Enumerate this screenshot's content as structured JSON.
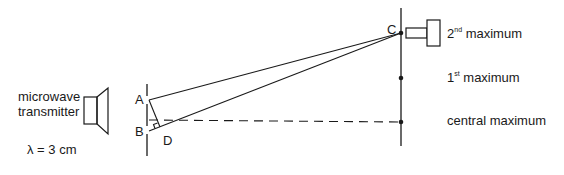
{
  "diagram": {
    "type": "microwave double-slit interference setup",
    "transmitter": {
      "label_line1": "microwave",
      "label_line2": "transmitter",
      "wavelength": "λ = 3 cm"
    },
    "points": {
      "A": "A",
      "B": "B",
      "C": "C",
      "D": "D"
    },
    "maxima": {
      "second": {
        "ordinal": "2",
        "suffix": "nd",
        "text": "maximum"
      },
      "first": {
        "ordinal": "1",
        "suffix": "st",
        "text": "maximum"
      },
      "central": {
        "text": "central maximum"
      }
    },
    "colors": {
      "line": "#1a1a1a",
      "background": "#ffffff"
    }
  }
}
